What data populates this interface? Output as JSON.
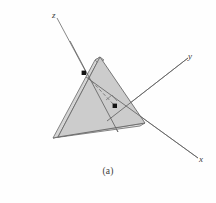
{
  "figure": {
    "caption": "(a)",
    "background_color": "#fefefe",
    "stroke_color": "#5a5a5a",
    "face_fill_color": "#c9c9c9",
    "edge_fill_color": "#dcdcdc",
    "marker_color": "#1a1a1a",
    "axes": [
      {
        "id": "z",
        "label": "z",
        "label_x": 52,
        "label_y": 11
      },
      {
        "id": "y",
        "label": "y",
        "label_x": 188,
        "label_y": 52
      },
      {
        "id": "x",
        "label": "x",
        "label_x": 199,
        "label_y": 155
      }
    ],
    "geometry": {
      "front_face": "100,57 58,137 145,123",
      "top_bevel": "100,57 96,62 53,138 58,137",
      "left_bevel": "58,137 53,138 140,126 145,123",
      "z_axis_line": {
        "x1": 57,
        "y1": 18,
        "x2": 118,
        "y2": 132
      },
      "y_axis_line": {
        "x1": 107,
        "y1": 121,
        "x2": 188,
        "y2": 58
      },
      "x_axis_line": {
        "x1": 86,
        "y1": 77,
        "x2": 198,
        "y2": 158
      },
      "dashed_line": {
        "x1": 84,
        "y1": 73,
        "x2": 115,
        "y2": 106
      },
      "right_angle": "106,101 111,97 115,102",
      "points": [
        {
          "name": "upper-left-point",
          "x": 84,
          "y": 73
        },
        {
          "name": "interior-point",
          "x": 115,
          "y": 106
        }
      ]
    }
  }
}
